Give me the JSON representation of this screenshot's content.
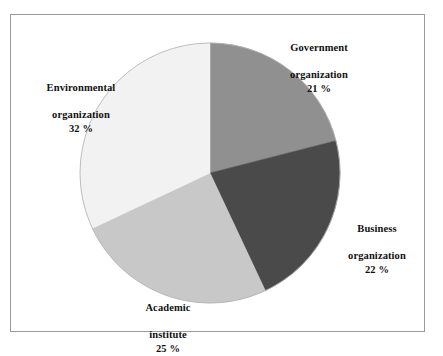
{
  "chart_data": {
    "type": "pie",
    "title": "",
    "subtitle": "",
    "xlabel": "",
    "ylabel": "",
    "legend_position": "none",
    "grid": false,
    "labels_outside": true,
    "start_angle_deg": 0,
    "direction": "clockwise",
    "categories": [
      "Government organization",
      "Business organization",
      "Academic institute",
      "Environmental organization"
    ],
    "values": [
      21,
      22,
      25,
      32
    ],
    "value_suffix": "%",
    "colors": [
      "#909090",
      "#4a4a4a",
      "#c8c8c8",
      "#f2f2f2"
    ],
    "slices": [
      {
        "name": "government",
        "label_line1": "Government",
        "label_line2": "organization",
        "value": 21,
        "value_text": "21 %",
        "color": "#909090"
      },
      {
        "name": "business",
        "label_line1": "Business",
        "label_line2": "organization",
        "value": 22,
        "value_text": "22 %",
        "color": "#4a4a4a"
      },
      {
        "name": "academic",
        "label_line1": "Academic",
        "label_line2": "institute",
        "value": 25,
        "value_text": "25 %",
        "color": "#c8c8c8"
      },
      {
        "name": "environmental",
        "label_line1": "Environmental",
        "label_line2": "organization",
        "value": 32,
        "value_text": "32 %",
        "color": "#f2f2f2"
      }
    ]
  },
  "figure": {
    "frame_color": "#9a9a9a",
    "background": "#ffffff",
    "pie_outline_color": "#b0b0b0"
  }
}
